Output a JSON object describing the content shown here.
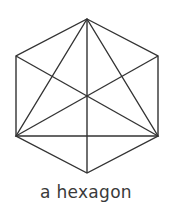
{
  "figure": {
    "caption": "a hexagon",
    "shape_name": "hexagon",
    "stroke_color": "#333333",
    "background_color": "#ffffff",
    "stroke_width": 1.4,
    "vertices": [
      {
        "name": "top",
        "x": 87,
        "y": 19
      },
      {
        "name": "top-right",
        "x": 158,
        "y": 56
      },
      {
        "name": "bottom-right",
        "x": 158,
        "y": 136
      },
      {
        "name": "bottom",
        "x": 87,
        "y": 173
      },
      {
        "name": "bottom-left",
        "x": 16,
        "y": 136
      },
      {
        "name": "top-left",
        "x": 16,
        "y": 56
      }
    ],
    "outline_points": "87,19 158,56 158,136 87,173 16,136 16,56",
    "diagonals": [
      {
        "name": "diagonal-top-to-bottom",
        "x1": 87,
        "y1": 19,
        "x2": 87,
        "y2": 173
      },
      {
        "name": "diagonal-topright-to-bottomleft",
        "x1": 158,
        "y1": 56,
        "x2": 16,
        "y2": 136
      },
      {
        "name": "diagonal-topleft-to-bottomright",
        "x1": 16,
        "y1": 56,
        "x2": 158,
        "y2": 136
      }
    ],
    "inscribed_triangle": {
      "name": "inscribed-triangle",
      "points": "87,19 158,136 16,136",
      "edges": [
        {
          "name": "triangle-edge-top-to-bottomright",
          "x1": 87,
          "y1": 19,
          "x2": 158,
          "y2": 136
        },
        {
          "name": "triangle-edge-top-to-bottomleft",
          "x1": 87,
          "y1": 19,
          "x2": 16,
          "y2": 136
        },
        {
          "name": "triangle-edge-base",
          "x1": 16,
          "y1": 136,
          "x2": 158,
          "y2": 136
        }
      ]
    },
    "center": {
      "name": "center-point",
      "x": 87,
      "y": 97
    }
  }
}
